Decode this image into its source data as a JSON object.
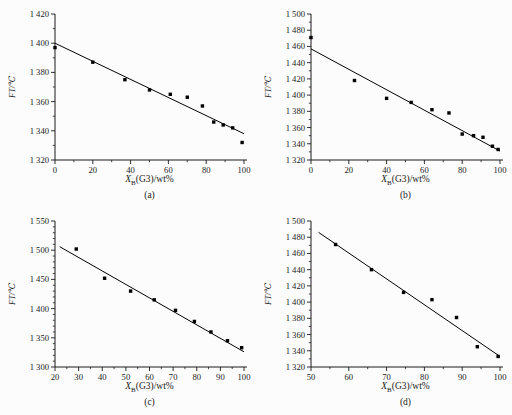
{
  "page": {
    "background": "#fcfcfc",
    "ink": "#1a1a1a"
  },
  "chart_data": [
    {
      "type": "scatter",
      "panel": "(a)",
      "xlabel": "X_B(G3)/wt%",
      "xlabel_var": "X",
      "xlabel_sub": "B",
      "xlabel_rest": "(G3)/wt%",
      "ylabel": "FT/℃",
      "xlim": [
        0,
        100
      ],
      "ylim": [
        1320,
        1420
      ],
      "xticks": [
        0,
        20,
        40,
        60,
        80,
        100
      ],
      "yticks": [
        1320,
        1340,
        1360,
        1380,
        1400,
        1420
      ],
      "x_minor_step": 10,
      "y_minor_step": 10,
      "grid": false,
      "legend": "none",
      "marker": "square",
      "color": "#000000",
      "points": [
        [
          0,
          1397
        ],
        [
          20,
          1387
        ],
        [
          37,
          1375
        ],
        [
          50,
          1368
        ],
        [
          61,
          1365
        ],
        [
          70,
          1363
        ],
        [
          78,
          1357
        ],
        [
          84,
          1346
        ],
        [
          89,
          1344
        ],
        [
          94,
          1342
        ],
        [
          99,
          1332
        ]
      ],
      "fit_line": {
        "x": [
          0,
          100
        ],
        "y": [
          1400,
          1338
        ]
      }
    },
    {
      "type": "scatter",
      "panel": "(b)",
      "xlabel": "X_B(G3)/wt%",
      "xlabel_var": "X",
      "xlabel_sub": "B",
      "xlabel_rest": "(G3)/wt%",
      "ylabel": "FT/℃",
      "xlim": [
        0,
        100
      ],
      "ylim": [
        1320,
        1500
      ],
      "xticks": [
        0,
        20,
        40,
        60,
        80,
        100
      ],
      "yticks": [
        1320,
        1340,
        1360,
        1380,
        1400,
        1420,
        1440,
        1460,
        1480,
        1500
      ],
      "x_minor_step": 10,
      "y_minor_step": 10,
      "grid": false,
      "legend": "none",
      "marker": "square",
      "color": "#000000",
      "points": [
        [
          0,
          1471
        ],
        [
          23,
          1418
        ],
        [
          40,
          1396
        ],
        [
          53,
          1391
        ],
        [
          64,
          1382
        ],
        [
          73,
          1378
        ],
        [
          80,
          1352
        ],
        [
          86,
          1350
        ],
        [
          91,
          1348
        ],
        [
          96,
          1337
        ],
        [
          99,
          1333
        ]
      ],
      "fit_line": {
        "x": [
          0,
          100
        ],
        "y": [
          1457,
          1331
        ]
      }
    },
    {
      "type": "scatter",
      "panel": "(c)",
      "xlabel": "X_B(G3)/wt%",
      "xlabel_var": "X",
      "xlabel_sub": "B",
      "xlabel_rest": "(G3)/wt%",
      "ylabel": "FT/℃",
      "xlim": [
        20,
        100
      ],
      "ylim": [
        1300,
        1550
      ],
      "xticks": [
        20,
        30,
        40,
        50,
        60,
        70,
        80,
        90,
        100
      ],
      "yticks": [
        1300,
        1350,
        1400,
        1450,
        1500,
        1550
      ],
      "x_minor_step": 5,
      "y_minor_step": 10,
      "grid": false,
      "legend": "none",
      "marker": "square",
      "color": "#000000",
      "points": [
        [
          29,
          1502
        ],
        [
          41,
          1452
        ],
        [
          52,
          1430
        ],
        [
          62,
          1415
        ],
        [
          71,
          1397
        ],
        [
          79,
          1378
        ],
        [
          86,
          1360
        ],
        [
          93,
          1345
        ],
        [
          99,
          1333
        ]
      ],
      "fit_line": {
        "x": [
          22,
          100
        ],
        "y": [
          1506,
          1326
        ]
      }
    },
    {
      "type": "scatter",
      "panel": "(d)",
      "xlabel": "X_B(G3)/wt%",
      "xlabel_var": "X",
      "xlabel_sub": "B",
      "xlabel_rest": "(G3)/wt%",
      "ylabel": "FT/℃",
      "xlim": [
        50,
        100
      ],
      "ylim": [
        1320,
        1500
      ],
      "xticks": [
        50,
        60,
        70,
        80,
        90,
        100
      ],
      "yticks": [
        1320,
        1340,
        1360,
        1380,
        1400,
        1420,
        1440,
        1460,
        1480,
        1500
      ],
      "x_minor_step": 5,
      "y_minor_step": 10,
      "grid": false,
      "legend": "none",
      "marker": "square",
      "color": "#000000",
      "points": [
        [
          56.5,
          1471
        ],
        [
          66,
          1440
        ],
        [
          74.5,
          1412
        ],
        [
          82,
          1403
        ],
        [
          88.5,
          1381
        ],
        [
          94,
          1345
        ],
        [
          99.5,
          1333
        ]
      ],
      "fit_line": {
        "x": [
          52,
          100
        ],
        "y": [
          1486,
          1333
        ]
      }
    }
  ]
}
